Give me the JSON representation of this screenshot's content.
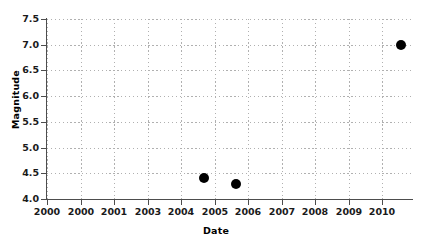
{
  "chart_data": {
    "type": "scatter",
    "title": "",
    "xlabel": "Date",
    "ylabel": "Magnitude",
    "xlim": [
      2000,
      2010.35
    ],
    "ylim": [
      4.0,
      7.5
    ],
    "grid": true,
    "grid_style": "dotted",
    "legend": "none",
    "marker": {
      "shape": "circle",
      "color": "#000000",
      "size_px": 10
    },
    "x_tick_labels": [
      "2000",
      "2000",
      "2001",
      "2003",
      "2004",
      "2005",
      "2006",
      "2007",
      "2008",
      "2009",
      "2010"
    ],
    "x_tick_values": [
      2000,
      2000.95,
      2001.9,
      2002.85,
      2003.8,
      2004.75,
      2005.7,
      2006.65,
      2007.6,
      2008.55,
      2009.5
    ],
    "y_tick_labels": [
      "4.0",
      "4.5",
      "5.0",
      "5.5",
      "6.0",
      "6.5",
      "7.0",
      "7.5"
    ],
    "y_tick_values": [
      4.0,
      4.5,
      5.0,
      5.5,
      6.0,
      6.5,
      7.0,
      7.5
    ],
    "points": [
      {
        "x": 2004.45,
        "y": 4.4,
        "label": "2004.45, 4.4"
      },
      {
        "x": 2005.35,
        "y": 4.3,
        "label": "2005.35, 4.3"
      },
      {
        "x": 2010.05,
        "y": 7.0,
        "label": "2010.05, 7.0"
      }
    ],
    "colors": {
      "background": "#ffffff",
      "axis": "#4d4d4d",
      "grid": "#b0b0b0",
      "text": "#1a1a1a",
      "marker": "#000000"
    }
  }
}
